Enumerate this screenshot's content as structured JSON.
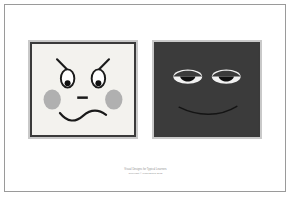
{
  "page": {
    "background_color": "#ffffff",
    "border_color": "#9a9a9a"
  },
  "figure": {
    "panels": [
      {
        "id": "panel-left",
        "expression_name": "worried",
        "face_color": "#f3f2ee",
        "mat_color": "#c9c9c9",
        "keyline_color": "#3a3a3a",
        "ink_color": "#1a1a1a",
        "blush_color": "#b0b0b0",
        "features": {
          "eyebrows": "slanted-worried",
          "eyes": "oval-pupil-low",
          "cheeks": "gray-oval-blush",
          "nose": "horizontal-dash",
          "mouth": "wavy-squiggle"
        }
      },
      {
        "id": "panel-right",
        "expression_name": "sleepy",
        "face_color": "#3b3b3b",
        "mat_color": "#c9c9c9",
        "keyline_color": "#3a3a3a",
        "ink_color": "#101010",
        "eye_white_color": "#f2f2f2",
        "features": {
          "eyebrows": "none",
          "eyes": "lens-half-lidded-white",
          "cheeks": "none",
          "nose": "none",
          "mouth": "subtle-curved-smile"
        }
      }
    ]
  },
  "caption": {
    "title": "Visual Designs for Typical Learners",
    "copyright": "Copyright © Linda Bloom 2012"
  }
}
